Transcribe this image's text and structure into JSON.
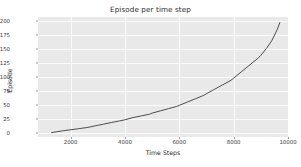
{
  "chart_data": {
    "type": "line",
    "title": "Episode per time step",
    "xlabel": "Time Steps",
    "ylabel": "Episode",
    "xlim": [
      800,
      10000
    ],
    "ylim": [
      -8,
      208
    ],
    "xticks": [
      2000,
      4000,
      6000,
      8000,
      10000
    ],
    "xtick_labels": [
      "2000",
      "4000",
      "6000",
      "8000",
      "10000"
    ],
    "yticks": [
      0,
      25,
      50,
      75,
      100,
      125,
      150,
      175,
      200
    ],
    "ytick_labels": [
      "0",
      "25",
      "50",
      "75",
      "100",
      "125",
      "150",
      "175",
      "200"
    ],
    "grid": true,
    "legend": false,
    "line_color": "#4d4d4d",
    "line_width": 1,
    "plot_bg": "#e9e9e9",
    "grid_color": "#fbfbfb",
    "figure_bg": "#ffffff",
    "series": [
      {
        "name": "Episode",
        "x": [
          1300,
          1700,
          2000,
          2300,
          2600,
          2900,
          3000,
          3200,
          3500,
          3800,
          4000,
          4300,
          4600,
          4900,
          5000,
          5300,
          5600,
          5900,
          6000,
          6300,
          6600,
          6900,
          7000,
          7300,
          7600,
          7900,
          8000,
          8300,
          8600,
          8900,
          9000,
          9200,
          9400,
          9600,
          9700
        ],
        "y": [
          0,
          3,
          5,
          7,
          9,
          12,
          13,
          15,
          18,
          21,
          23,
          27,
          30,
          33,
          35,
          39,
          43,
          47,
          49,
          55,
          61,
          67,
          70,
          78,
          86,
          94,
          98,
          110,
          122,
          134,
          139,
          151,
          165,
          185,
          198
        ]
      }
    ]
  }
}
